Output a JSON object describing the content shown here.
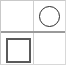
{
  "figure": {
    "width": 66,
    "height": 65,
    "background_color": "#ffffff",
    "grid": {
      "rows": 2,
      "columns": 2,
      "border_color": "#cfcfcf",
      "divider_color": "#9a9a9a",
      "frame_color": "#d8d8d8"
    },
    "cells": [
      {
        "id": "cell-top-left",
        "row": 1,
        "column": 1,
        "shape": "none",
        "label": ""
      },
      {
        "id": "cell-top-right",
        "row": 1,
        "column": 2,
        "shape": "circle",
        "label": "",
        "stroke_color": "#2b2b2b",
        "fill_color": "none",
        "stroke_width": 1.6
      },
      {
        "id": "cell-bottom-left",
        "row": 2,
        "column": 1,
        "shape": "square",
        "label": "",
        "stroke_color": "#5a5a5a",
        "fill_color": "none",
        "stroke_width": 2
      },
      {
        "id": "cell-bottom-right",
        "row": 2,
        "column": 2,
        "shape": "none",
        "label": ""
      }
    ]
  }
}
